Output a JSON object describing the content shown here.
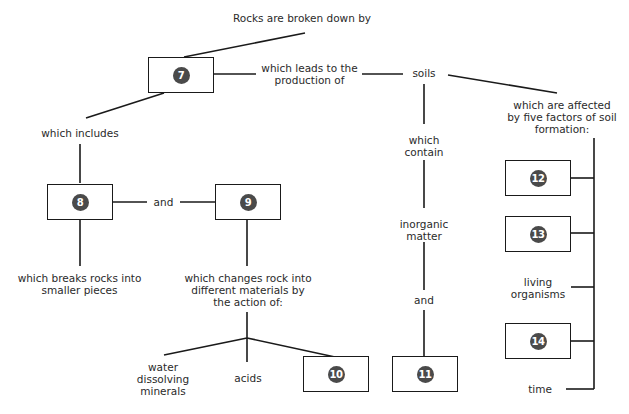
{
  "diagram": {
    "title": "Rocks are broken down by",
    "nodes": {
      "box7": "7",
      "box8": "8",
      "box9": "9",
      "box10": "10",
      "box11": "11",
      "box12": "12",
      "box13": "13",
      "box14": "14"
    },
    "labels": {
      "leads_to": [
        "which leads to the",
        "production of"
      ],
      "soils": "soils",
      "includes": "which includes",
      "and_8_9": "and",
      "breaks": [
        "which breaks rocks into",
        "smaller pieces"
      ],
      "changes": [
        "which changes rock into",
        "different materials by",
        "the action of:"
      ],
      "water": [
        "water",
        "dissolving",
        "minerals"
      ],
      "acids": "acids",
      "contain": [
        "which",
        "contain"
      ],
      "inorganic": [
        "inorganic",
        "matter"
      ],
      "and_11": "and",
      "affected": [
        "which are affected",
        "by five factors of soil",
        "formation:"
      ],
      "living": [
        "living",
        "organisms"
      ],
      "time": "time"
    }
  }
}
